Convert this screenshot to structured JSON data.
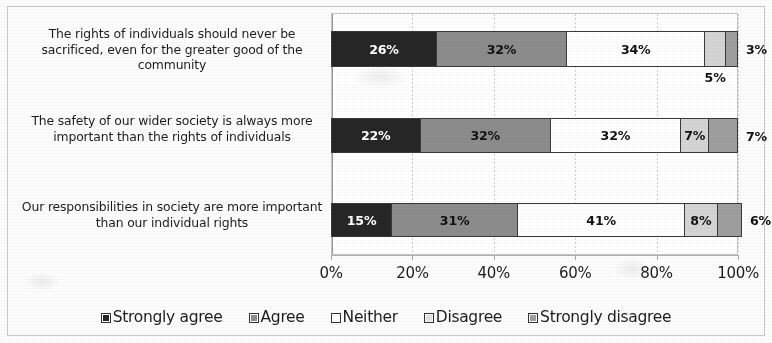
{
  "chart_data": {
    "type": "bar",
    "subtype": "100% stacked horizontal bar",
    "title": "",
    "xlabel": "",
    "ylabel": "",
    "xlim": [
      0,
      100
    ],
    "grid": true,
    "legend_position": "bottom",
    "categories": [
      "The rights of individuals should never be sacrificed, even for the greater good of the community",
      "The safety of our wider society is always more important than the rights of individuals",
      "Our responsibilities in society are more important than our individual rights"
    ],
    "xticks": [
      "0%",
      "20%",
      "40%",
      "60%",
      "80%",
      "100%"
    ],
    "xtick_values": [
      0,
      20,
      40,
      60,
      80,
      100
    ],
    "series": [
      {
        "name": "Strongly agree",
        "color": "#262626",
        "values": [
          26,
          22,
          15
        ],
        "labels": [
          "26%",
          "22%",
          "15%"
        ]
      },
      {
        "name": "Agree",
        "color": "#8c8c8c",
        "values": [
          32,
          32,
          31
        ],
        "labels": [
          "32%",
          "32%",
          "31%"
        ]
      },
      {
        "name": "Neither",
        "color": "#ffffff",
        "values": [
          34,
          32,
          41
        ],
        "labels": [
          "34%",
          "32%",
          "41%"
        ]
      },
      {
        "name": "Disagree",
        "color": "#d4d4d4",
        "values": [
          5,
          7,
          8
        ],
        "labels": [
          "5%",
          "7%",
          "8%"
        ]
      },
      {
        "name": "Strongly disagree",
        "color": "#9e9e9e",
        "values": [
          3,
          7,
          6
        ],
        "labels": [
          "3%",
          "7%",
          "6%"
        ]
      }
    ]
  },
  "legend": {
    "items": [
      {
        "label": "Strongly agree",
        "swatch_name": "legend-swatch-strongly-agree",
        "color": "#262626"
      },
      {
        "label": "Agree",
        "swatch_name": "legend-swatch-agree",
        "color": "#8c8c8c"
      },
      {
        "label": "Neither",
        "swatch_name": "legend-swatch-neither",
        "color": "#ffffff"
      },
      {
        "label": "Disagree",
        "swatch_name": "legend-swatch-disagree",
        "color": "#e2e2e2"
      },
      {
        "label": "Strongly disagree",
        "swatch_name": "legend-swatch-strongly-disagree",
        "color": "#9e9e9e"
      }
    ]
  }
}
